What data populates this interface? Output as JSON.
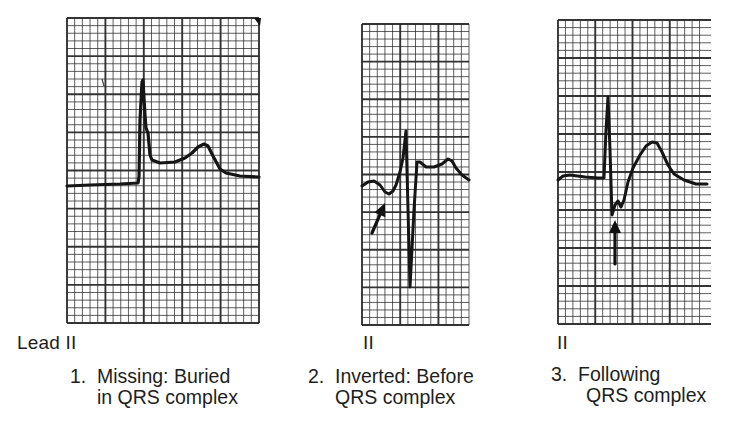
{
  "figure": {
    "grid": {
      "small_square_px": 7.6,
      "large_square_every": 5,
      "line_color": "#2a2a2a",
      "background": "#ffffff"
    },
    "trace_color": "#151515",
    "strips": [
      {
        "id": "strip-1",
        "lead_label": "Lead II",
        "caption_number": "1.",
        "caption_line1": "Missing: Buried",
        "caption_line2": "in QRS complex",
        "p_wave_position": "Missing (buried in QRS)",
        "box": {
          "x": 67,
          "y": 18,
          "w": 192,
          "h": 305
        },
        "trace_points": [
          [
            67,
            186
          ],
          [
            90,
            185
          ],
          [
            120,
            184
          ],
          [
            138,
            183
          ],
          [
            139,
            177
          ],
          [
            140,
            120
          ],
          [
            142,
            82
          ],
          [
            143,
            80
          ],
          [
            145,
            115
          ],
          [
            146,
            128
          ],
          [
            148,
            133
          ],
          [
            150,
            155
          ],
          [
            152,
            160
          ],
          [
            160,
            163
          ],
          [
            175,
            162
          ],
          [
            185,
            158
          ],
          [
            192,
            153
          ],
          [
            198,
            147
          ],
          [
            204,
            144
          ],
          [
            208,
            146
          ],
          [
            213,
            156
          ],
          [
            220,
            169
          ],
          [
            226,
            173
          ],
          [
            240,
            176
          ],
          [
            259,
            177
          ]
        ],
        "arrow": null
      },
      {
        "id": "strip-2",
        "lead_label": "II",
        "caption_number": "2.",
        "caption_line1": "Inverted: Before",
        "caption_line2": "QRS complex",
        "p_wave_position": "Inverted, before QRS",
        "box": {
          "x": 362,
          "y": 24,
          "w": 107,
          "h": 301
        },
        "trace_points": [
          [
            362,
            186
          ],
          [
            368,
            182
          ],
          [
            374,
            181
          ],
          [
            380,
            185
          ],
          [
            385,
            192
          ],
          [
            389,
            194
          ],
          [
            393,
            191
          ],
          [
            396,
            185
          ],
          [
            400,
            172
          ],
          [
            403,
            158
          ],
          [
            406,
            131
          ],
          [
            410,
            287
          ],
          [
            414,
            210
          ],
          [
            417,
            162
          ],
          [
            420,
            162
          ],
          [
            426,
            167
          ],
          [
            434,
            167
          ],
          [
            442,
            164
          ],
          [
            448,
            159
          ],
          [
            452,
            161
          ],
          [
            456,
            168
          ],
          [
            462,
            175
          ],
          [
            469,
            180
          ]
        ],
        "arrow": {
          "from": [
            372,
            233
          ],
          "to": [
            385,
            203
          ]
        }
      },
      {
        "id": "strip-3",
        "lead_label": "II",
        "caption_number": "3.",
        "caption_line1": "Following",
        "caption_line2": "QRS complex",
        "p_wave_position": "Following QRS",
        "box": {
          "x": 558,
          "y": 20,
          "w": 149,
          "h": 304
        },
        "trace_points": [
          [
            558,
            180
          ],
          [
            563,
            176
          ],
          [
            570,
            175
          ],
          [
            585,
            177
          ],
          [
            598,
            178
          ],
          [
            604,
            178
          ],
          [
            606,
            130
          ],
          [
            608,
            97
          ],
          [
            610,
            150
          ],
          [
            612,
            215
          ],
          [
            615,
            205
          ],
          [
            618,
            201
          ],
          [
            621,
            207
          ],
          [
            624,
            200
          ],
          [
            628,
            182
          ],
          [
            633,
            168
          ],
          [
            640,
            155
          ],
          [
            646,
            146
          ],
          [
            652,
            142
          ],
          [
            657,
            143
          ],
          [
            662,
            152
          ],
          [
            668,
            165
          ],
          [
            674,
            174
          ],
          [
            684,
            180
          ],
          [
            696,
            184
          ],
          [
            707,
            184
          ]
        ],
        "arrow": {
          "from": [
            615,
            264
          ],
          "to": [
            615,
            220
          ]
        }
      }
    ]
  }
}
